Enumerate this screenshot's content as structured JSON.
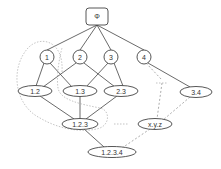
{
  "diagram": {
    "root": {
      "label": "Φ",
      "x": 97,
      "y": 16
    },
    "level1": [
      {
        "label": "1",
        "x": 47,
        "y": 57
      },
      {
        "label": "2",
        "x": 80,
        "y": 57
      },
      {
        "label": "3",
        "x": 111,
        "y": 57
      },
      {
        "label": "4",
        "x": 144,
        "y": 57
      }
    ],
    "level2": [
      {
        "label": "1.2",
        "x": 35,
        "y": 91
      },
      {
        "label": "1.3",
        "x": 80,
        "y": 91
      },
      {
        "label": "2.3",
        "x": 121,
        "y": 91
      },
      {
        "label": "3.4",
        "x": 196,
        "y": 92
      }
    ],
    "level3": [
      {
        "label": "1.2.3",
        "x": 80,
        "y": 124
      },
      {
        "label": "x.y.z",
        "x": 155,
        "y": 124
      }
    ],
    "level4": [
      {
        "label": "1.2.3.4",
        "x": 112,
        "y": 152
      }
    ],
    "colors": {
      "stroke": "#444444",
      "dashed": "#888888",
      "dotted": "#aaaaaa"
    }
  }
}
